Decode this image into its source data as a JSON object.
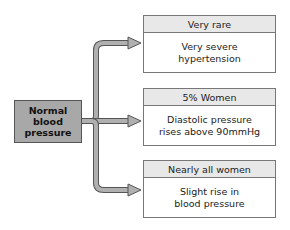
{
  "diagram": {
    "source": {
      "label": "Normal\nblood\npressure"
    },
    "outcomes": [
      {
        "header": "Very rare",
        "body": "Very severe\nhypertension"
      },
      {
        "header": "5% Women",
        "body": "Diastolic pressure\nrises above 90mmHg"
      },
      {
        "header": "Nearly all women",
        "body": "Slight rise in\nblood pressure"
      }
    ],
    "colors": {
      "source_fill": "#a8a8a8",
      "header_fill": "#e8e8e8",
      "arrow_fill": "#b0b0b0",
      "arrow_stroke": "#555555",
      "border": "#777777"
    }
  }
}
